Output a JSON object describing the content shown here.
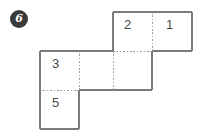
{
  "badge": {
    "label": "6",
    "shape": "circle",
    "fill_color": "#3a3a3a",
    "text_color": "#ffffff"
  },
  "figure": {
    "type": "cube-net-diagram",
    "title": "",
    "cell_size": 39,
    "stroke_color": "#7a7a7a",
    "dotted_color": "#9a9a9a",
    "label_color": "#4a4a4a",
    "cells": [
      {
        "name": "cell-2",
        "label": "2",
        "col": 2,
        "row": 0,
        "x": 113,
        "y": 12
      },
      {
        "name": "cell-1",
        "label": "1",
        "col": 3,
        "row": 0,
        "x": 152,
        "y": 12
      },
      {
        "name": "cell-3",
        "label": "3",
        "col": 0,
        "row": 1,
        "x": 40,
        "y": 51
      },
      {
        "name": "cell-blank-a",
        "label": "",
        "col": 1,
        "row": 1,
        "x": 79,
        "y": 51
      },
      {
        "name": "cell-blank-b",
        "label": "",
        "col": 2,
        "row": 1,
        "x": 113,
        "y": 51
      },
      {
        "name": "cell-5",
        "label": "5",
        "col": 0,
        "row": 2,
        "x": 40,
        "y": 90
      }
    ],
    "labels": [
      {
        "text": "2",
        "x": 128,
        "y": 24
      },
      {
        "text": "1",
        "x": 169,
        "y": 24
      },
      {
        "text": "3",
        "x": 55,
        "y": 63
      },
      {
        "text": "5",
        "x": 55,
        "y": 102
      }
    ]
  }
}
